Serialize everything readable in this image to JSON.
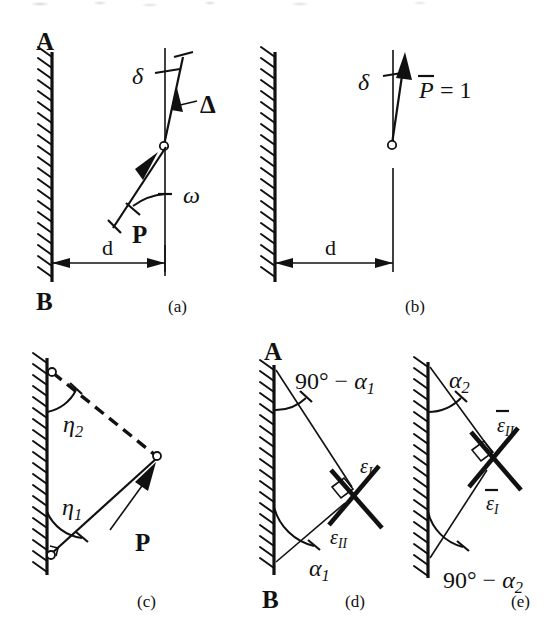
{
  "figure": {
    "background": "#ffffff",
    "ink_color": "#111111",
    "width": 558,
    "height": 644
  },
  "panels": [
    {
      "id": "a",
      "caption": "(a)",
      "labels": {
        "wall_top": "A",
        "wall_bottom": "B",
        "deflection": "δ",
        "displacement": "Δ",
        "angle": "ω",
        "force": "P",
        "distance": "d"
      }
    },
    {
      "id": "b",
      "caption": "(b)",
      "labels": {
        "deflection": "δ",
        "unit_load": "P̄ = 1",
        "distance": "d"
      }
    },
    {
      "id": "c",
      "caption": "(c)",
      "labels": {
        "angle_upper": "η₂",
        "angle_lower": "η₁",
        "force": "P"
      }
    },
    {
      "id": "d",
      "caption": "(d)",
      "labels": {
        "wall_top": "A",
        "wall_bottom": "B",
        "angle_top": "90° − α₁",
        "angle_bottom": "α₁",
        "strain_one": "ε_I",
        "strain_two": "ε_II"
      }
    },
    {
      "id": "e",
      "caption": "(e)",
      "labels": {
        "angle_top": "α₂",
        "angle_bottom": "90° − α₂",
        "strain_one": "ε̄_I",
        "strain_two": "ε̄_II"
      }
    }
  ],
  "text": {
    "A_a": "A",
    "B_a": "B",
    "delta_a": "δ",
    "Delta_a": "Δ",
    "omega_a": "ω",
    "P_a": "P",
    "d_a": "d",
    "cap_a": "(a)",
    "delta_b": "δ",
    "Pbar_b": "P",
    "eq1_b": "= 1",
    "d_b": "d",
    "cap_b": "(b)",
    "eta2_c": "η",
    "eta2_sub_c": "2",
    "eta1_c": "η",
    "eta1_sub_c": "1",
    "P_c": "P",
    "cap_c": "(c)",
    "A_d": "A",
    "B_d": "B",
    "ninety_d": "90° − ",
    "alpha_d": "α",
    "alpha_sub_d": "1",
    "alpha1_d": "α",
    "alpha1_sub_d": "1",
    "epsI_d": "ε",
    "epsI_sub_d": "I",
    "epsII_d": "ε",
    "epsII_sub_d": "II",
    "cap_d": "(d)",
    "alpha2_e": "α",
    "alpha2_sub_e": "2",
    "ninety_e": "90° − ",
    "alphaB_e": "α",
    "alphaB_sub_e": "2",
    "epsIIbar_e": "ε",
    "epsIIbar_sub_e": "II",
    "epsIbar_e": "ε",
    "epsIbar_sub_e": "I",
    "cap_e": "(e)"
  }
}
